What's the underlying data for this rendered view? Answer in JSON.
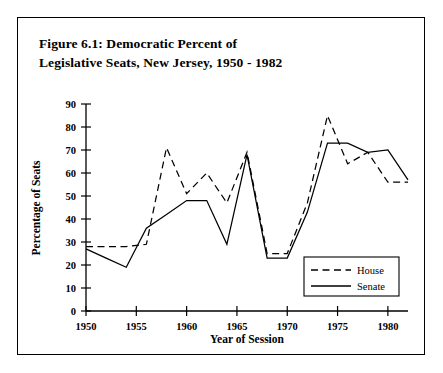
{
  "figure": {
    "title_line1": "Figure 6.1: Democratic Percent of",
    "title_line2": "Legislative Seats, New Jersey, 1950 - 1982"
  },
  "chart_data": {
    "type": "line",
    "title": "Figure 6.1: Democratic Percent of Legislative Seats, New Jersey, 1950 - 1982",
    "xlabel": "Year of Session",
    "ylabel": "Percentage of Seats",
    "xlim": [
      1950,
      1982
    ],
    "ylim": [
      0,
      90
    ],
    "xticks": [
      1950,
      1955,
      1960,
      1965,
      1970,
      1975,
      1980
    ],
    "xtick_labels": [
      "1950",
      "1955",
      "1960",
      "1965",
      "1970",
      "1975",
      "1980"
    ],
    "yticks": [
      0,
      10,
      20,
      30,
      40,
      50,
      60,
      70,
      80,
      90
    ],
    "ytick_labels": [
      "0",
      "10",
      "20",
      "30",
      "40",
      "50",
      "60",
      "70",
      "80",
      "90"
    ],
    "grid": false,
    "legend_position": "lower-right",
    "x": [
      1950,
      1952,
      1954,
      1956,
      1958,
      1960,
      1962,
      1964,
      1966,
      1968,
      1970,
      1972,
      1974,
      1976,
      1978,
      1980,
      1982
    ],
    "series": [
      {
        "name": "House",
        "style": "dashed",
        "values": [
          28,
          28,
          28,
          29,
          71,
          51,
          60,
          47,
          69,
          25,
          25,
          47,
          85,
          64,
          69,
          56,
          56
        ]
      },
      {
        "name": "Senate",
        "style": "solid",
        "values": [
          27,
          23,
          19,
          36,
          42,
          48,
          48,
          29,
          68,
          23,
          23,
          43,
          73,
          73,
          69,
          70,
          57
        ]
      }
    ]
  },
  "legend": {
    "house_label": "House",
    "senate_label": "Senate"
  }
}
